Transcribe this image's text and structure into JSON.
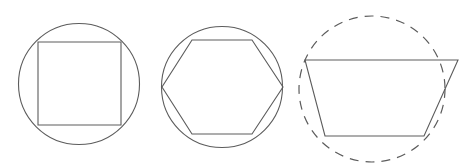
{
  "figure": {
    "background_color": "#ffffff",
    "stroke_color": "#5c5c5c",
    "width": 465,
    "height": 168,
    "panel_count": 3
  },
  "panels": [
    {
      "id": "panel-1",
      "name": "circle-with-inscribed-square",
      "circle": {
        "style": "solid",
        "center_x": 79,
        "center_y": 84,
        "radius": 60.5
      },
      "polygon": {
        "name": "square",
        "sides": 4,
        "style": "solid",
        "points": "38,42 121,42 121,125 38,125"
      }
    },
    {
      "id": "panel-2",
      "name": "circle-with-inscribed-hexagon",
      "circle": {
        "style": "solid",
        "center_x": 222,
        "center_y": 87,
        "radius": 60.5
      },
      "polygon": {
        "name": "hexagon",
        "sides": 6,
        "style": "solid",
        "points": "192,40 252,40 283,87 252,134 192,134 162,87"
      }
    },
    {
      "id": "panel-3",
      "name": "dashed-circle-with-trapezoid",
      "circle": {
        "style": "dashed",
        "center_x": 372,
        "center_y": 89,
        "radius": 73,
        "dash_pattern": "9 7"
      },
      "polygon": {
        "name": "trapezoid",
        "sides": 4,
        "style": "solid",
        "points": "305,60 458,60 424,136 325,136"
      }
    }
  ],
  "chart_data": {
    "type": "diagram",
    "shapes": [
      {
        "panel": 1,
        "circle_style": "solid",
        "circle_center": [
          79,
          84
        ],
        "circle_radius": 60.5,
        "polygon": "square",
        "polygon_vertices": [
          [
            38,
            42
          ],
          [
            121,
            42
          ],
          [
            121,
            125
          ],
          [
            38,
            125
          ]
        ]
      },
      {
        "panel": 2,
        "circle_style": "solid",
        "circle_center": [
          222,
          87
        ],
        "circle_radius": 60.5,
        "polygon": "hexagon",
        "polygon_vertices": [
          [
            192,
            40
          ],
          [
            252,
            40
          ],
          [
            283,
            87
          ],
          [
            252,
            134
          ],
          [
            192,
            134
          ],
          [
            162,
            87
          ]
        ]
      },
      {
        "panel": 3,
        "circle_style": "dashed",
        "circle_center": [
          372,
          89
        ],
        "circle_radius": 73,
        "polygon": "trapezoid",
        "polygon_vertices": [
          [
            305,
            60
          ],
          [
            458,
            60
          ],
          [
            424,
            136
          ],
          [
            325,
            136
          ]
        ]
      }
    ]
  }
}
